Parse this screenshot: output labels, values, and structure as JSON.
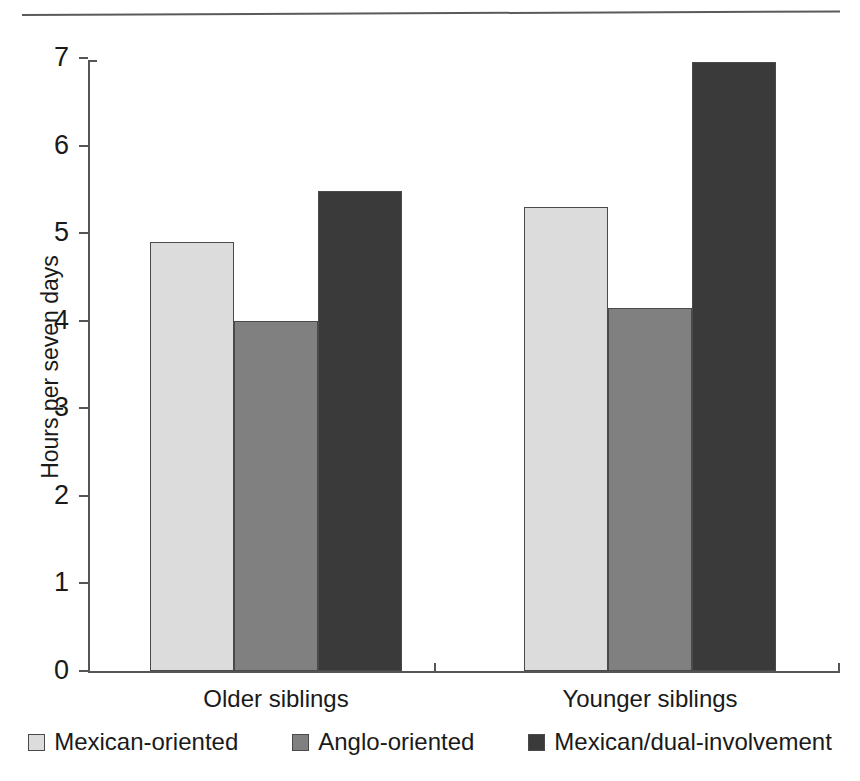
{
  "chart_data": {
    "type": "bar",
    "title": "",
    "subtitle": "",
    "xlabel": "",
    "ylabel": "Hours per seven days",
    "categories": [
      "Older siblings",
      "Younger siblings"
    ],
    "series": [
      {
        "name": "Mexican-oriented",
        "values": [
          4.9,
          5.3
        ],
        "color": "#dcdcdc"
      },
      {
        "name": "Anglo-oriented",
        "values": [
          4.0,
          4.15
        ],
        "color": "#808080"
      },
      {
        "name": "Mexican/dual-involvement",
        "values": [
          5.48,
          6.95
        ],
        "color": "#3a3a3a"
      }
    ],
    "ylim": [
      0,
      7
    ],
    "yticks": [
      "0",
      "1",
      "2",
      "3",
      "4",
      "5",
      "6",
      "7"
    ],
    "grid": false,
    "legend_position": "bottom"
  },
  "legend": {
    "items": [
      {
        "label": "Mexican-oriented",
        "swatch": "light-gray-swatch"
      },
      {
        "label": "Anglo-oriented",
        "swatch": "medium-gray-swatch"
      },
      {
        "label": "Mexican/dual-involvement",
        "swatch": "dark-gray-swatch"
      }
    ]
  },
  "colors": {
    "series_light": "#dcdcdc",
    "series_medium": "#808080",
    "series_dark": "#3a3a3a",
    "axis": "#555555",
    "text": "#1a1a1a",
    "rule": "#5a5a5a"
  }
}
